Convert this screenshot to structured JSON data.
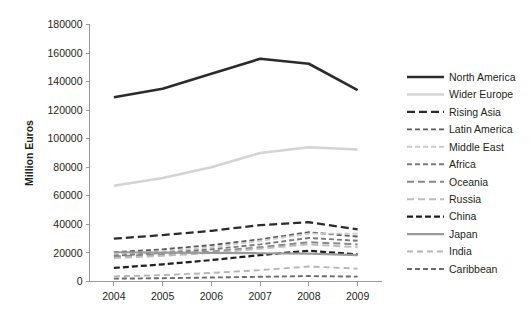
{
  "chart_data": {
    "type": "line",
    "title": "",
    "xlabel": "",
    "ylabel": "Million Euros",
    "categories": [
      "2004",
      "2005",
      "2006",
      "2007",
      "2008",
      "2009"
    ],
    "x": [
      2004,
      2005,
      2006,
      2007,
      2008,
      2009
    ],
    "ylim": [
      0,
      180000
    ],
    "ytick_step": 20000,
    "yticks": [
      0,
      20000,
      40000,
      60000,
      80000,
      100000,
      120000,
      140000,
      160000,
      180000
    ],
    "ytick_labels": [
      "0",
      "20000",
      "40000",
      "60000",
      "80000",
      "100000",
      "120000",
      "140000",
      "160000",
      "180000"
    ],
    "grid": false,
    "legend_position": "right",
    "series": [
      {
        "name": "North America",
        "values": [
          129000,
          135000,
          145500,
          156000,
          152500,
          134000
        ],
        "color": "#2b2b2b",
        "width": 2.6,
        "dash": "none"
      },
      {
        "name": "Wider Europe",
        "values": [
          67000,
          72500,
          80000,
          90000,
          94000,
          92500
        ],
        "color": "#d4d4d4",
        "width": 2.6,
        "dash": "none"
      },
      {
        "name": "Rising Asia",
        "values": [
          30000,
          32500,
          35500,
          39500,
          41500,
          36500
        ],
        "color": "#2b2b2b",
        "width": 2.3,
        "dash": "8,4"
      },
      {
        "name": "Latin America",
        "values": [
          20500,
          22500,
          25500,
          29500,
          34500,
          31500
        ],
        "color": "#5a5a5a",
        "width": 1.9,
        "dash": "5,3"
      },
      {
        "name": "Middle East",
        "values": [
          19000,
          21000,
          24000,
          28500,
          33500,
          33500
        ],
        "color": "#c9c9c9",
        "width": 1.9,
        "dash": "5,3"
      },
      {
        "name": "Africa",
        "values": [
          18000,
          20000,
          22500,
          26000,
          30500,
          28500
        ],
        "color": "#7a7a7a",
        "width": 1.9,
        "dash": "5,3"
      },
      {
        "name": "Oceania",
        "values": [
          17500,
          19000,
          21000,
          24000,
          27500,
          26000
        ],
        "color": "#888888",
        "width": 2.0,
        "dash": "7,4"
      },
      {
        "name": "Russia",
        "values": [
          16500,
          18000,
          20000,
          23000,
          26000,
          24000
        ],
        "color": "#bdbdbd",
        "width": 2.0,
        "dash": "7,4"
      },
      {
        "name": "China",
        "values": [
          9500,
          12000,
          15000,
          18500,
          21500,
          19000
        ],
        "color": "#1f1f1f",
        "width": 2.2,
        "dash": "6,3"
      },
      {
        "name": "Japan",
        "values": [
          20500,
          20200,
          20000,
          19800,
          19500,
          18500
        ],
        "color": "#9a9a9a",
        "width": 2.2,
        "dash": "none"
      },
      {
        "name": "India",
        "values": [
          3500,
          4500,
          6000,
          8000,
          10500,
          9000
        ],
        "color": "#b5b5b5",
        "width": 1.9,
        "dash": "6,4"
      },
      {
        "name": "Caribbean",
        "values": [
          2000,
          2300,
          2800,
          3300,
          3800,
          3400
        ],
        "color": "#6b6b6b",
        "width": 1.9,
        "dash": "5,3"
      }
    ]
  }
}
